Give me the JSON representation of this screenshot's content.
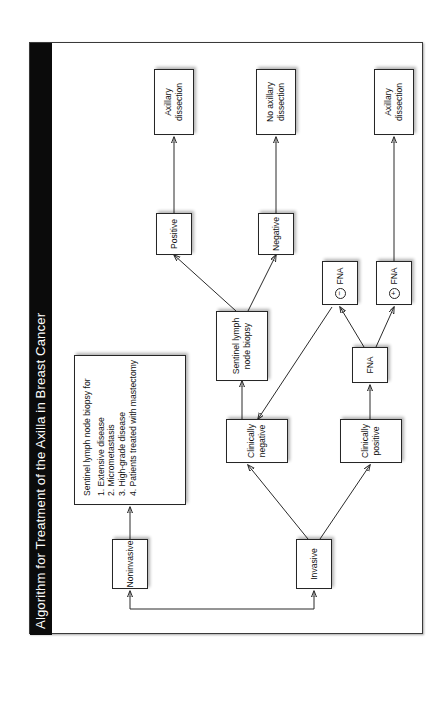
{
  "figure": {
    "title": "Algorithm for Treatment of the Axilla in Breast Cancer",
    "orientation": "rotated-90-ccw",
    "colors": {
      "title_bar": "#0b0b0b",
      "title_text": "#ffffff",
      "box_border": "#262626",
      "edge": "#2b2b2b",
      "background": "#ffffff"
    }
  },
  "nodes": {
    "noninvasive": {
      "label": "Noninvasive"
    },
    "invasive": {
      "label": "Invasive"
    },
    "slnb_criteria": {
      "heading": "Sentinel lymph node biopsy for",
      "items": [
        "1.  Extensive disease",
        "2.  Micrometastasis",
        "3.  High-grade disease",
        "4.  Patients treated with mastectomy"
      ]
    },
    "clinically_positive": {
      "label": "Clinically positive"
    },
    "clinically_negative": {
      "label": "Clinically negative"
    },
    "fna": {
      "label": "FNA"
    },
    "fna_positive": {
      "sign": "+",
      "label": "FNA"
    },
    "fna_negative": {
      "sign": "−",
      "label": "FNA"
    },
    "slnb": {
      "label": "Sentinel lymph node biopsy"
    },
    "sln_positive": {
      "label": "Positive"
    },
    "sln_negative": {
      "label": "Negative"
    },
    "axillary_dissection_fna": {
      "label": "Axillary dissection"
    },
    "no_axillary_dissection": {
      "label": "No axillary dissection"
    },
    "axillary_dissection_sln": {
      "label": "Axillary dissection"
    }
  },
  "edges": [
    {
      "from": "root",
      "to": "noninvasive"
    },
    {
      "from": "root",
      "to": "invasive"
    },
    {
      "from": "noninvasive",
      "to": "slnb_criteria"
    },
    {
      "from": "invasive",
      "to": "clinically_positive"
    },
    {
      "from": "invasive",
      "to": "clinically_negative"
    },
    {
      "from": "clinically_positive",
      "to": "fna"
    },
    {
      "from": "fna",
      "to": "fna_positive"
    },
    {
      "from": "fna",
      "to": "fna_negative"
    },
    {
      "from": "fna_negative",
      "to": "clinically_negative"
    },
    {
      "from": "fna_positive",
      "to": "axillary_dissection_fna"
    },
    {
      "from": "clinically_negative",
      "to": "slnb"
    },
    {
      "from": "slnb",
      "to": "sln_positive"
    },
    {
      "from": "slnb",
      "to": "sln_negative"
    },
    {
      "from": "sln_positive",
      "to": "axillary_dissection_sln"
    },
    {
      "from": "sln_negative",
      "to": "no_axillary_dissection"
    }
  ]
}
